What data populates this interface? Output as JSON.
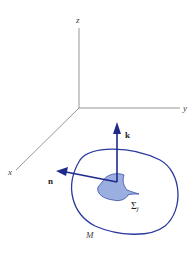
{
  "diagram": {
    "axes": {
      "z_label": "z",
      "y_label": "y",
      "x_label": "x"
    },
    "vectors": {
      "k_label": "k",
      "n_label": "n"
    },
    "region_label": "M",
    "surface_label_base": "Σ",
    "surface_label_sub": "j",
    "colors": {
      "axis": "#888888",
      "curve": "#2b3a9e",
      "fill": "#9aaee0",
      "arrow": "#1f2a8a"
    }
  }
}
